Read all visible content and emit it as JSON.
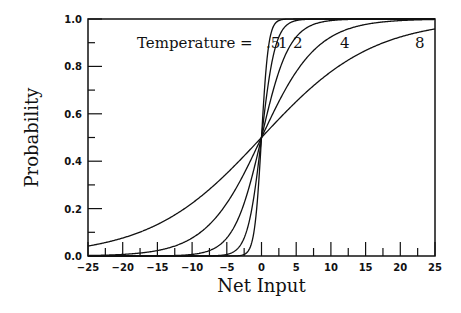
{
  "chart_data": {
    "type": "line",
    "title": "",
    "xlabel": "Net Input",
    "ylabel": "Probability",
    "xlim": [
      -25,
      25
    ],
    "ylim": [
      0.0,
      1.0
    ],
    "x_ticks": [
      -25,
      -20,
      -15,
      -10,
      -5,
      0,
      5,
      10,
      15,
      20,
      25
    ],
    "x_tick_labels": [
      "−25",
      "−20",
      "−15",
      "−10",
      "−5",
      "0",
      "5",
      "10",
      "15",
      "20",
      "25"
    ],
    "y_ticks": [
      0.0,
      0.2,
      0.4,
      0.6,
      0.8,
      1.0
    ],
    "y_tick_labels": [
      "0.0",
      "0.2",
      "0.4",
      "0.6",
      "0.8",
      "1.0"
    ],
    "grid": false,
    "legend": null,
    "function": "p = 1 / (1 + exp(-x / T))",
    "annotation": "Temperature =",
    "series": [
      {
        "name": ".5",
        "temperature": 0.5,
        "x": [
          -25,
          -20,
          -15,
          -10,
          -5,
          -2.5,
          0,
          2.5,
          5,
          10,
          15,
          20,
          25
        ],
        "values": [
          0.0,
          0.0,
          0.0,
          0.0,
          5e-05,
          0.0067,
          0.5,
          0.9933,
          0.99995,
          1.0,
          1.0,
          1.0,
          1.0
        ]
      },
      {
        "name": "1",
        "temperature": 1,
        "x": [
          -25,
          -20,
          -15,
          -10,
          -5,
          -2.5,
          0,
          2.5,
          5,
          10,
          15,
          20,
          25
        ],
        "values": [
          0.0,
          0.0,
          0.0,
          5e-05,
          0.0067,
          0.0759,
          0.5,
          0.9241,
          0.9933,
          0.99995,
          1.0,
          1.0,
          1.0
        ]
      },
      {
        "name": "2",
        "temperature": 2,
        "x": [
          -25,
          -20,
          -15,
          -10,
          -5,
          -2.5,
          0,
          2.5,
          5,
          10,
          15,
          20,
          25
        ],
        "values": [
          0.0,
          5e-05,
          0.0006,
          0.0067,
          0.0759,
          0.2227,
          0.5,
          0.7773,
          0.9241,
          0.9933,
          0.9994,
          0.99995,
          1.0
        ]
      },
      {
        "name": "4",
        "temperature": 4,
        "x": [
          -25,
          -20,
          -15,
          -10,
          -5,
          -2.5,
          0,
          2.5,
          5,
          10,
          15,
          20,
          25
        ],
        "values": [
          0.0019,
          0.0067,
          0.023,
          0.0759,
          0.2227,
          0.3486,
          0.5,
          0.6514,
          0.7773,
          0.9241,
          0.977,
          0.9933,
          0.9981
        ]
      },
      {
        "name": "8",
        "temperature": 8,
        "x": [
          -25,
          -20,
          -15,
          -10,
          -5,
          -2.5,
          0,
          2.5,
          5,
          10,
          15,
          20,
          25
        ],
        "values": [
          0.0421,
          0.0759,
          0.1329,
          0.2227,
          0.3486,
          0.4225,
          0.5,
          0.5775,
          0.6514,
          0.7773,
          0.8671,
          0.9241,
          0.9579
        ]
      }
    ],
    "curve_labels": [
      {
        "text": "Temperature =",
        "x_px": 137,
        "y_px": 48
      },
      {
        "text": ".5",
        "x_px": 266,
        "y_px": 48
      },
      {
        "text": "1",
        "x_px": 278,
        "y_px": 48
      },
      {
        "text": "2",
        "x_px": 293,
        "y_px": 48
      },
      {
        "text": "4",
        "x_px": 340,
        "y_px": 48
      },
      {
        "text": "8",
        "x_px": 415,
        "y_px": 48
      }
    ]
  },
  "colors": {
    "line": "#111111",
    "background": "#ffffff"
  }
}
